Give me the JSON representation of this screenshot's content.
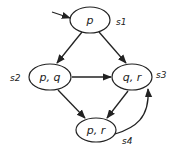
{
  "diagram": {
    "type": "kripke-structure",
    "nodes": [
      {
        "id": "s1",
        "label": "p",
        "state": "s1",
        "initial": true
      },
      {
        "id": "s2",
        "label": "p, q",
        "state": "s2"
      },
      {
        "id": "s3",
        "label": "q, r",
        "state": "s3"
      },
      {
        "id": "s4",
        "label": "p, r",
        "state": "s4"
      }
    ],
    "edges": [
      {
        "from": "s1",
        "to": "s2"
      },
      {
        "from": "s1",
        "to": "s3"
      },
      {
        "from": "s2",
        "to": "s3"
      },
      {
        "from": "s2",
        "to": "s4"
      },
      {
        "from": "s3",
        "to": "s4"
      },
      {
        "from": "s4",
        "to": "s3"
      }
    ],
    "colors": {
      "stroke": "#222222",
      "background": "#ffffff"
    }
  }
}
